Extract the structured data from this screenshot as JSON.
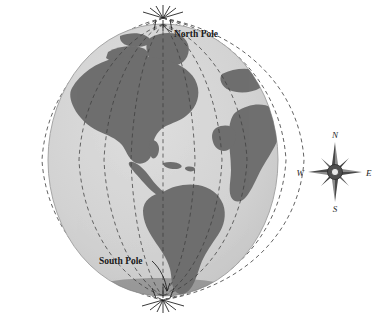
{
  "figure": {
    "background_color": "#ffffff"
  },
  "globe": {
    "name": "earth-globe",
    "center_x": 163,
    "center_y": 160,
    "radius_x": 115,
    "radius_y": 136,
    "ocean_color": "#d2d2d2",
    "land_color": "#6f6f6f",
    "outline_color": "#9a9a9a",
    "labels": {
      "north_pole": "North Pole",
      "south_pole": "South Pole"
    },
    "meridians": {
      "style": "dashed",
      "color": "#4a4a4a",
      "count_outer": 7,
      "count_inner": 7,
      "converge_top_y": 18,
      "converge_bottom_y": 300
    },
    "visible_landmasses": [
      "North America",
      "South America",
      "Greenland",
      "Africa",
      "Europe"
    ]
  },
  "compass": {
    "name": "compass-rose",
    "center_x": 335,
    "center_y": 172,
    "star_color": "#3c3c3c",
    "hub_color": "#555555",
    "directions": {
      "north": "N",
      "south": "S",
      "east": "E",
      "west": "W"
    }
  }
}
